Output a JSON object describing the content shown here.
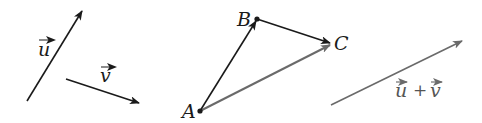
{
  "diagram": {
    "colors": {
      "black": "#1a1a1a",
      "gray": "#6a6a6a"
    },
    "vectors": [
      {
        "id": "u",
        "label": "u",
        "from": [
          27,
          101
        ],
        "to": [
          82,
          11
        ],
        "color": "#1a1a1a"
      },
      {
        "id": "v",
        "label": "v",
        "from": [
          66,
          79
        ],
        "to": [
          139,
          103
        ],
        "color": "#1a1a1a"
      },
      {
        "id": "AB",
        "from_point": "A",
        "to_point": "B",
        "color": "#1a1a1a"
      },
      {
        "id": "BC",
        "from_point": "B",
        "to_point": "C",
        "color": "#1a1a1a"
      },
      {
        "id": "AC",
        "from_point": "A",
        "to_point": "C",
        "color": "#6a6a6a"
      },
      {
        "id": "u_plus_v",
        "label": "u + v",
        "from": [
          331,
          105
        ],
        "to": [
          462,
          41
        ],
        "color": "#6a6a6a"
      }
    ],
    "points": [
      {
        "name": "A",
        "x": 200,
        "y": 111
      },
      {
        "name": "B",
        "x": 257,
        "y": 19
      },
      {
        "name": "C",
        "x": 332,
        "y": 44
      }
    ],
    "labels": {
      "u": "u",
      "v": "v",
      "A": "A",
      "B": "B",
      "C": "C",
      "sum_u": "u",
      "sum_plus": "+",
      "sum_v": "v"
    }
  }
}
